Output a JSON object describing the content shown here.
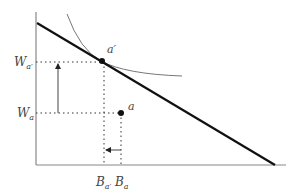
{
  "diagram": {
    "axes": {
      "origin": [
        36,
        165
      ],
      "y_top": 12,
      "x_right": 286,
      "color": "#888888"
    },
    "budget_line": {
      "from": [
        37,
        23
      ],
      "to": [
        275,
        165
      ],
      "color": "#111111"
    },
    "indifference_curve": {
      "path": "M 67 14 Q 80 50 101 61 Q 125 74 182 76",
      "color": "#777777"
    },
    "points": [
      {
        "id": "a_prime",
        "label": "a′",
        "x": 101,
        "y": 61
      },
      {
        "id": "a",
        "label": "a",
        "x": 121,
        "y": 113
      }
    ],
    "y_labels": [
      {
        "main": "W",
        "sub": "a′",
        "y": 62
      },
      {
        "main": "W",
        "sub": "a",
        "y": 113
      }
    ],
    "x_labels": [
      {
        "main": "B",
        "sub": "a′",
        "x": 104
      },
      {
        "main": "B",
        "sub": "a",
        "x": 121
      }
    ],
    "arrows": [
      {
        "id": "wealth-increase",
        "from": [
          58,
          113
        ],
        "to": [
          58,
          63
        ]
      },
      {
        "id": "b-decrease",
        "from": [
          121,
          150
        ],
        "to": [
          105,
          150
        ]
      }
    ]
  }
}
